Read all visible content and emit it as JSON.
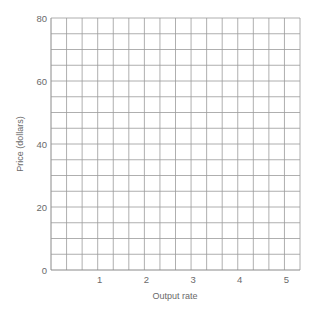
{
  "chart_data": {
    "type": "line",
    "title": "",
    "xlabel": "Output rate",
    "ylabel": "Price (dollars)",
    "xlim": [
      0,
      5.333
    ],
    "ylim": [
      0,
      80
    ],
    "x_ticks": [
      1,
      2,
      3,
      4,
      5
    ],
    "x_tick_labels": [
      "1",
      "2",
      "3",
      "4",
      "5"
    ],
    "y_ticks": [
      0,
      20,
      40,
      60,
      80
    ],
    "y_tick_labels": [
      "0",
      "20",
      "40",
      "60",
      "80"
    ],
    "grid": true,
    "grid_columns": 16,
    "grid_rows": 16,
    "x_minor_step": 0.3333,
    "y_minor_step": 5,
    "series": [],
    "legend": null,
    "note": "Blank graph-paper grid; no data plotted"
  },
  "layout": {
    "plot_left": 51,
    "plot_right": 300,
    "plot_top": 18,
    "plot_bottom": 270,
    "grid_color": "#9a9a9a",
    "text_color": "#6a6a6a"
  }
}
